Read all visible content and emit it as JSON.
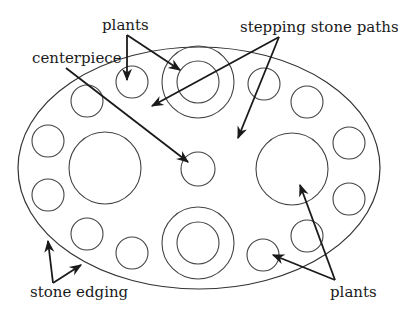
{
  "diagram": {
    "labels": {
      "plants_top": "plants",
      "stepping_stone_paths": "stepping stone paths",
      "centerpiece": "centerpiece",
      "stone_edging": "stone edging",
      "plants_bottom": "plants"
    },
    "colors": {
      "background": "#ffffff",
      "stroke": "#444444",
      "arrow": "#1a1a1a",
      "text": "#1a1a1a"
    },
    "elements": {
      "border": {
        "shape": "ellipse",
        "cx": 199,
        "cy": 168,
        "rx": 181,
        "ry": 121,
        "meaning": "stone edging"
      },
      "centerpiece": {
        "shape": "circle",
        "cx": 198,
        "cy": 169,
        "r": 17
      },
      "stepping_stones": [
        {
          "cx": 198,
          "cy": 82,
          "r_outer": 36,
          "r_inner": 21
        },
        {
          "cx": 198,
          "cy": 243,
          "r_outer": 36,
          "r_inner": 21
        }
      ],
      "large_plants": [
        {
          "cx": 105,
          "cy": 168,
          "r": 36
        },
        {
          "cx": 292,
          "cy": 169,
          "r": 36
        }
      ],
      "small_plants": [
        {
          "cx": 132,
          "cy": 82,
          "r": 16
        },
        {
          "cx": 87,
          "cy": 101,
          "r": 16
        },
        {
          "cx": 264,
          "cy": 84,
          "r": 16
        },
        {
          "cx": 307,
          "cy": 102,
          "r": 16
        },
        {
          "cx": 48,
          "cy": 141,
          "r": 16
        },
        {
          "cx": 48,
          "cy": 195,
          "r": 16
        },
        {
          "cx": 349,
          "cy": 143,
          "r": 16
        },
        {
          "cx": 349,
          "cy": 199,
          "r": 16
        },
        {
          "cx": 87,
          "cy": 234,
          "r": 16
        },
        {
          "cx": 132,
          "cy": 253,
          "r": 16
        },
        {
          "cx": 263,
          "cy": 255,
          "r": 16
        },
        {
          "cx": 307,
          "cy": 236,
          "r": 16
        }
      ]
    }
  }
}
